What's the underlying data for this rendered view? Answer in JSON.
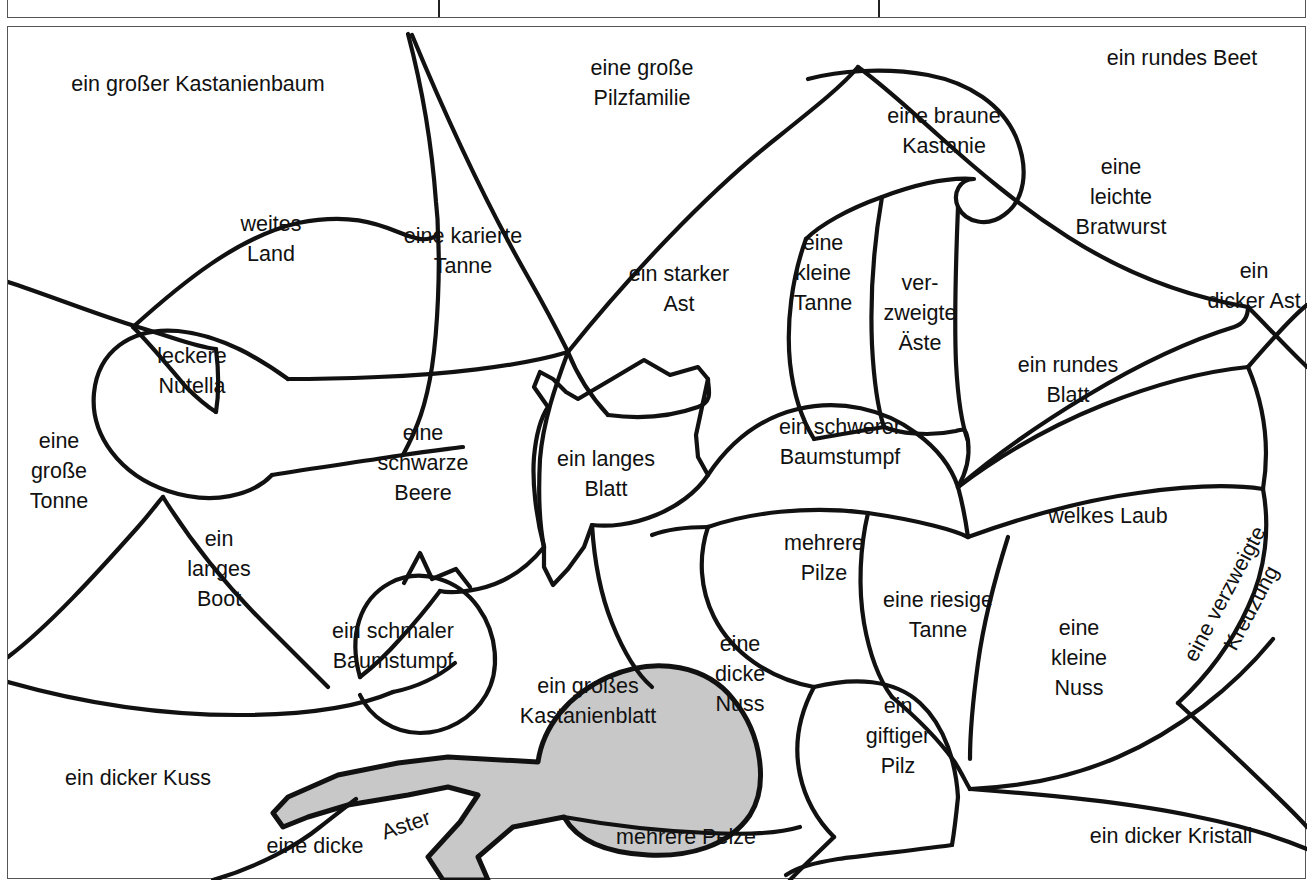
{
  "page": {
    "background_color": "#ffffff",
    "line_color": "#111111",
    "highlight_fill": "#c8c8c8",
    "border_color": "#555555"
  },
  "top_table": {
    "description": "abgeschnittene Tabellenzeile am oberen Rand",
    "divider_positions": [
      430,
      870
    ]
  },
  "diagram": {
    "name": "beschriftete Regionenkarte",
    "shaded_region_label": "ein großes Kastanienblatt",
    "labels": [
      {
        "id": "kastanienbaum",
        "text": "ein großer Kastanienbaum",
        "x": 190,
        "y": 83,
        "rotation": 0
      },
      {
        "id": "pilzfamilie",
        "text": "eine große\nPilzfamilie",
        "x": 634,
        "y": 82,
        "rotation": 0
      },
      {
        "id": "rundes-beet",
        "text": "ein rundes Beet",
        "x": 1174,
        "y": 57,
        "rotation": 0
      },
      {
        "id": "braune-kastanie",
        "text": "eine braune\nKastanie",
        "x": 936,
        "y": 130,
        "rotation": 0
      },
      {
        "id": "leichte-bratwurst",
        "text": "eine\nleichte\nBratwurst",
        "x": 1113,
        "y": 196,
        "rotation": 0
      },
      {
        "id": "weites-land",
        "text": "weites\nLand",
        "x": 263,
        "y": 238,
        "rotation": 0
      },
      {
        "id": "karierte-tanne",
        "text": "eine karierte\nTanne",
        "x": 455,
        "y": 250,
        "rotation": 0
      },
      {
        "id": "starker-ast",
        "text": "ein starker\nAst",
        "x": 671,
        "y": 288,
        "rotation": 0
      },
      {
        "id": "kleine-tanne",
        "text": "eine\nkleine\nTanne",
        "x": 815,
        "y": 272,
        "rotation": 0
      },
      {
        "id": "verzweigte-aeste",
        "text": "ver-\nzweigte\nÄste",
        "x": 912,
        "y": 312,
        "rotation": 0
      },
      {
        "id": "dicker-ast",
        "text": "ein\ndicker Ast",
        "x": 1246,
        "y": 285,
        "rotation": 0
      },
      {
        "id": "rundes-blatt",
        "text": "ein rundes\nBlatt",
        "x": 1060,
        "y": 379,
        "rotation": 0
      },
      {
        "id": "leckere-nutella",
        "text": "leckere\nNutella",
        "x": 184,
        "y": 370,
        "rotation": 0
      },
      {
        "id": "grosse-tonne",
        "text": "eine\ngroße\nTonne",
        "x": 51,
        "y": 470,
        "rotation": 0
      },
      {
        "id": "schwarze-beere",
        "text": "eine\nschwarze\nBeere",
        "x": 415,
        "y": 462,
        "rotation": 0
      },
      {
        "id": "langes-blatt",
        "text": "ein langes\nBlatt",
        "x": 598,
        "y": 473,
        "rotation": 0
      },
      {
        "id": "schwerer-baumstumpf",
        "text": "ein schwerer\nBaumstumpf",
        "x": 832,
        "y": 441,
        "rotation": 0
      },
      {
        "id": "welkes-laub",
        "text": "welkes Laub",
        "x": 1100,
        "y": 515,
        "rotation": 0
      },
      {
        "id": "langes-boot",
        "text": "ein\nlanges\nBoot",
        "x": 211,
        "y": 568,
        "rotation": 0
      },
      {
        "id": "mehrere-pilze",
        "text": "mehrere\nPilze",
        "x": 816,
        "y": 557,
        "rotation": 0
      },
      {
        "id": "riesige-tanne",
        "text": "eine riesige\nTanne",
        "x": 930,
        "y": 614,
        "rotation": 0
      },
      {
        "id": "kleine-nuss",
        "text": "eine\nkleine\nNuss",
        "x": 1071,
        "y": 657,
        "rotation": 0
      },
      {
        "id": "verzweigte-kreuzung",
        "text": "eine verzweigte\nKreuzung",
        "x": 1230,
        "y": 600,
        "rotation": -62
      },
      {
        "id": "schmaler-baumstumpf",
        "text": "ein schmaler\nBaumstumpf",
        "x": 385,
        "y": 645,
        "rotation": 0
      },
      {
        "id": "grosses-kastanienblatt",
        "text": "ein großes\nKastanienblatt",
        "x": 580,
        "y": 700,
        "rotation": 0
      },
      {
        "id": "dicke-nuss",
        "text": "eine\ndicke\nNuss",
        "x": 732,
        "y": 673,
        "rotation": 0
      },
      {
        "id": "giftiger-pilz",
        "text": "ein\ngiftiger\nPilz",
        "x": 890,
        "y": 735,
        "rotation": 0
      },
      {
        "id": "dicker-kuss",
        "text": "ein dicker Kuss",
        "x": 130,
        "y": 777,
        "rotation": 0
      },
      {
        "id": "dicke-vorn",
        "text": "eine dicke",
        "x": 307,
        "y": 845,
        "rotation": 0
      },
      {
        "id": "aster",
        "text": "Aster",
        "x": 398,
        "y": 824,
        "rotation": -19
      },
      {
        "id": "mehrere-pelze",
        "text": "mehrere Pelze",
        "x": 678,
        "y": 836,
        "rotation": 0
      },
      {
        "id": "dicker-kristall",
        "text": "ein dicker Kristall",
        "x": 1163,
        "y": 835,
        "rotation": 0
      }
    ]
  }
}
